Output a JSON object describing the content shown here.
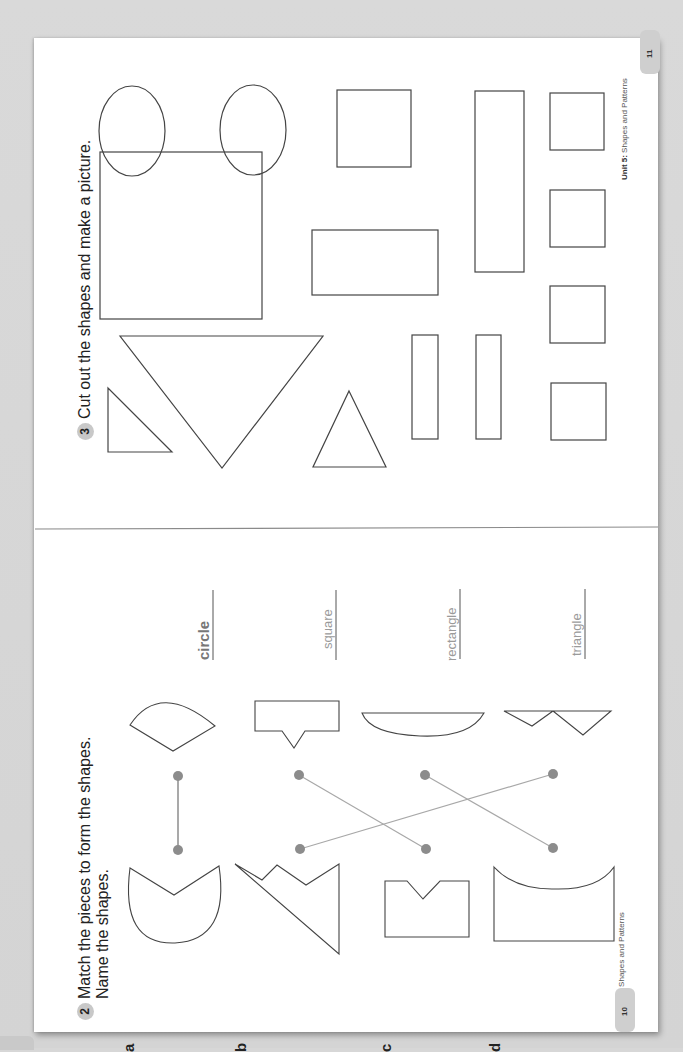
{
  "pages": {
    "left": {
      "page_number": "10",
      "footer": {
        "unit": "Unit 5:",
        "title": "Shapes and Patterns"
      },
      "exercise": {
        "number": "2",
        "instruction_line1": "Match the pieces to form the shapes.",
        "instruction_line2": "Name the shapes.",
        "rows": [
          {
            "letter": "a",
            "answer": "circle"
          },
          {
            "letter": "b",
            "answer": "square"
          },
          {
            "letter": "c",
            "answer": "rectangle"
          },
          {
            "letter": "d",
            "answer": "triangle"
          }
        ],
        "matches": [
          {
            "from": "a",
            "to": "a"
          },
          {
            "from": "b",
            "to": "d"
          },
          {
            "from": "c",
            "to": "b"
          },
          {
            "from": "d",
            "to": "c"
          }
        ]
      }
    },
    "right": {
      "page_number": "11",
      "footer": {
        "unit": "Unit 5:",
        "title": "Shapes and Patterns"
      },
      "exercise": {
        "number": "3",
        "instruction": "Cut out the shapes and make a picture.",
        "shapes": [
          "circle",
          "circle",
          "large square",
          "triangle",
          "large triangle",
          "triangle",
          "square",
          "rectangle",
          "long rectangle",
          "thin rectangle",
          "thin rectangle",
          "square",
          "square",
          "square",
          "square"
        ]
      }
    }
  },
  "colors": {
    "background": "#d7d7d7",
    "page": "#ffffff",
    "outline": "#444444",
    "match_line": "#a8a8a8",
    "match_dot": "#8c8c8c",
    "badge": "#c8c8c8"
  }
}
